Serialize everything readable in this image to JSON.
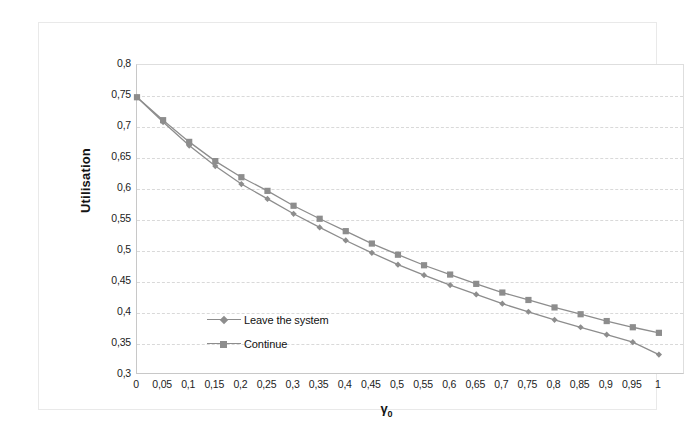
{
  "chart_data": {
    "type": "line",
    "title": "",
    "xlabel": "γ₀",
    "ylabel": "Utilisation",
    "xlim": [
      0,
      1.05
    ],
    "ylim": [
      0.3,
      0.8
    ],
    "grid": true,
    "legend_position": "inside-lower-left",
    "x_tick_labels": [
      "0",
      "0,05",
      "0,1",
      "0,15",
      "0,2",
      "0,25",
      "0,3",
      "0,35",
      "0,4",
      "0,45",
      "0,5",
      "0,55",
      "0,6",
      "0,65",
      "0,7",
      "0,75",
      "0,8",
      "0,85",
      "0,9",
      "0,95",
      "1"
    ],
    "x_tick_values": [
      0,
      0.05,
      0.1,
      0.15,
      0.2,
      0.25,
      0.3,
      0.35,
      0.4,
      0.45,
      0.5,
      0.55,
      0.6,
      0.65,
      0.7,
      0.75,
      0.8,
      0.85,
      0.9,
      0.95,
      1
    ],
    "y_tick_labels": [
      "0,8",
      "0,75",
      "0,7",
      "0,65",
      "0,6",
      "0,55",
      "0,5",
      "0,45",
      "0,4",
      "0,35",
      "0,3"
    ],
    "y_tick_values": [
      0.8,
      0.75,
      0.7,
      0.65,
      0.6,
      0.55,
      0.5,
      0.45,
      0.4,
      0.35,
      0.3
    ],
    "x": [
      0,
      0.05,
      0.1,
      0.15,
      0.2,
      0.25,
      0.3,
      0.35,
      0.4,
      0.45,
      0.5,
      0.55,
      0.6,
      0.65,
      0.7,
      0.75,
      0.8,
      0.85,
      0.9,
      0.95,
      1
    ],
    "series": [
      {
        "name": "Continue",
        "marker": "square",
        "color": "#8d8d8d",
        "values": [
          0.748,
          0.711,
          0.676,
          0.645,
          0.619,
          0.597,
          0.573,
          0.552,
          0.532,
          0.512,
          0.494,
          0.477,
          0.462,
          0.447,
          0.433,
          0.421,
          0.409,
          0.398,
          0.387,
          0.377,
          0.368
        ]
      },
      {
        "name": "Leave the system",
        "marker": "diamond",
        "color": "#8d8d8d",
        "values": [
          0.748,
          0.708,
          0.67,
          0.637,
          0.608,
          0.584,
          0.56,
          0.538,
          0.517,
          0.497,
          0.478,
          0.461,
          0.445,
          0.43,
          0.415,
          0.402,
          0.389,
          0.377,
          0.365,
          0.353,
          0.333
        ]
      }
    ]
  },
  "legend": {
    "items": [
      {
        "label": "Leave the system",
        "marker": "diamond"
      },
      {
        "label": "Continue",
        "marker": "square"
      }
    ]
  },
  "axes": {
    "y_title": "Utilisation",
    "x_title_glyph": "γ",
    "x_title_subscript": "0"
  }
}
